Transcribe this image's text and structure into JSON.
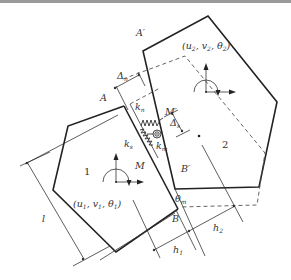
{
  "diagram": {
    "blocks": [
      {
        "id": "1",
        "label": "1",
        "dof": [
          "u",
          "v",
          "θ"
        ],
        "dof_sub": "1"
      },
      {
        "id": "2",
        "label": "2",
        "dof": [
          "u",
          "v",
          "θ"
        ],
        "dof_sub": "2"
      }
    ],
    "labels": {
      "A": "A",
      "A_prime": "A′",
      "B": "B",
      "B_prime": "B′",
      "M": "M",
      "M_prime": "M′",
      "delta_n": "Δ",
      "delta_n_sub": "n",
      "delta_s": "Δ",
      "delta_s_sub": "s",
      "k_n": "k",
      "k_n_sub": "n",
      "k_s": "k",
      "k_s_sub": "s",
      "k_m": "k",
      "k_m_sub": "m",
      "theta_m": "θ",
      "theta_m_sub": "m",
      "l": "l",
      "h1": "h",
      "h1_sub": "1",
      "h2": "h",
      "h2_sub": "2",
      "block1_num": "1",
      "block2_num": "2",
      "block1_coords_open": "(",
      "block1_u": "u",
      "block1_v": "v",
      "block1_theta": "θ",
      "block1_sub": "1",
      "block2_u": "u",
      "block2_v": "v",
      "block2_theta": "θ",
      "block2_sub": "2",
      "comma": ", ",
      "close": ")"
    },
    "colors": {
      "line": "#222222",
      "thin_line": "#333333",
      "dashed": "#555555",
      "top_bar": "#9a9a9a"
    }
  }
}
